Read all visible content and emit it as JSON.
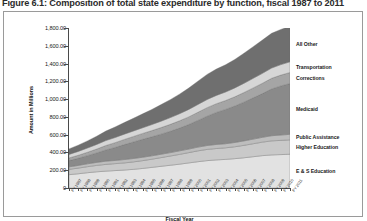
{
  "figure": {
    "caption": "Figure 6.1: Composition of total state expenditure by function, fiscal 1987 to 2011"
  },
  "chart_data": {
    "type": "area",
    "title": "Figure 6.1: Composition of total state expenditure by function, fiscal 1987 to 2011",
    "subtitle": "",
    "xlabel": "Fiscal Year",
    "ylabel": "Amount in Millions",
    "stacked": true,
    "grid": false,
    "legend_position": "right-inline",
    "ylim": [
      0,
      1800
    ],
    "ytick_labels": [
      "0",
      "200.00",
      "400.00",
      "600.00",
      "800.00",
      "1,000.00",
      "1,200.00",
      "1,400.00",
      "1,600.00",
      "1,800.00"
    ],
    "ytick_values": [
      0,
      200,
      400,
      600,
      800,
      1000,
      1200,
      1400,
      1600,
      1800
    ],
    "categories": [
      "FY 1987",
      "FY 1988",
      "FY 1989",
      "FY 1990",
      "FY 1991",
      "FY 1992",
      "FY 1993",
      "FY 1994",
      "FY 1995",
      "FY 1996",
      "FY 1997",
      "FY 1998",
      "FY 1999",
      "FY 2000",
      "FY 2001",
      "FY 2002",
      "FY 2003",
      "FY 2004",
      "FY 2005",
      "FY 2006",
      "FY 2007",
      "FY 2008",
      "FY 2009",
      "FY 2010",
      "FY 2011"
    ],
    "series": [
      {
        "name": "E & S Education",
        "color": "#e2e2e2",
        "values": [
          150,
          160,
          172,
          182,
          190,
          196,
          202,
          210,
          220,
          232,
          244,
          256,
          268,
          282,
          296,
          308,
          316,
          322,
          330,
          340,
          352,
          364,
          372,
          376,
          380
        ]
      },
      {
        "name": "Higher Education",
        "color": "#c9c9c9",
        "values": [
          60,
          64,
          68,
          72,
          76,
          78,
          80,
          84,
          88,
          92,
          98,
          104,
          110,
          116,
          122,
          126,
          128,
          130,
          134,
          140,
          146,
          152,
          158,
          160,
          162
        ]
      },
      {
        "name": "Public Assistance",
        "color": "#bdbdbd",
        "values": [
          28,
          30,
          32,
          34,
          36,
          36,
          38,
          38,
          38,
          38,
          38,
          38,
          40,
          40,
          42,
          44,
          46,
          46,
          48,
          50,
          52,
          54,
          58,
          60,
          62
        ]
      },
      {
        "name": "Medicaid",
        "color": "#8a8a8a",
        "values": [
          70,
          80,
          92,
          106,
          126,
          146,
          168,
          186,
          202,
          214,
          226,
          240,
          256,
          276,
          300,
          330,
          360,
          386,
          410,
          436,
          464,
          492,
          526,
          552,
          572
        ]
      },
      {
        "name": "Corrections",
        "color": "#a5a5a5",
        "values": [
          30,
          34,
          38,
          44,
          50,
          54,
          58,
          62,
          66,
          70,
          74,
          78,
          82,
          86,
          92,
          96,
          98,
          100,
          104,
          108,
          112,
          116,
          120,
          122,
          124
        ]
      },
      {
        "name": "Transportation",
        "color": "#d6d6d6",
        "values": [
          40,
          44,
          48,
          52,
          56,
          58,
          60,
          62,
          64,
          68,
          72,
          76,
          80,
          84,
          88,
          92,
          94,
          96,
          100,
          104,
          108,
          112,
          116,
          118,
          120
        ]
      },
      {
        "name": "All Other",
        "color": "#6f6f6f",
        "values": [
          62,
          70,
          80,
          92,
          106,
          118,
          130,
          142,
          156,
          170,
          186,
          202,
          220,
          240,
          262,
          282,
          296,
          306,
          320,
          338,
          356,
          374,
          390,
          396,
          400
        ]
      }
    ]
  },
  "axes": {
    "y_title": "Amount in Millions",
    "x_title": "Fiscal Year"
  }
}
